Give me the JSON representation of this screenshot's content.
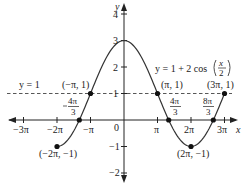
{
  "chart_data": {
    "type": "line",
    "title": "",
    "equation_label": "y = 1 + 2 cos(x/2)",
    "xlabel": "x",
    "ylabel": "y",
    "xlim": [
      -3.14159,
      3.14159
    ],
    "x_range_pi": [
      -3,
      3
    ],
    "ylim": [
      -2,
      4
    ],
    "grid": false,
    "x_ticks": [
      "-3π",
      "-2π",
      "-π",
      "0",
      "π",
      "2π",
      "3π"
    ],
    "y_ticks": [
      "4",
      "3",
      "2",
      "1",
      "-1",
      "-2"
    ],
    "series": [
      {
        "name": "y = 1 + 2 cos(x/2)",
        "domain_pi": [
          -2,
          3
        ],
        "x": [
          "-2π",
          "-4π/3",
          "-π",
          "0",
          "π",
          "4π/3",
          "2π",
          "8π/3",
          "3π"
        ],
        "values": [
          -1,
          0,
          1,
          3,
          1,
          0,
          -1,
          0,
          1
        ]
      },
      {
        "name": "y = 1",
        "style": "dashed",
        "values": [
          1
        ]
      }
    ],
    "points": [
      {
        "label": "(-2π, -1)",
        "x_pi": -2,
        "y": -1
      },
      {
        "label": "(-π, 1)",
        "x_pi": -1,
        "y": 1
      },
      {
        "label": "(π, 1)",
        "x_pi": 1,
        "y": 1
      },
      {
        "label": "(2π, -1)",
        "x_pi": 2,
        "y": -1
      },
      {
        "label": "(3π, 1)",
        "x_pi": 3,
        "y": 1
      },
      {
        "label": "-4π/3",
        "x_pi": -1.3333,
        "y": 0
      },
      {
        "label": "4π/3",
        "x_pi": 1.3333,
        "y": 0
      },
      {
        "label": "8π/3",
        "x_pi": 2.6667,
        "y": 0
      }
    ],
    "annotations": {
      "hline": "y = 1",
      "equation": "y = 1 + 2 cos(x/2)",
      "zero_frac_left": {
        "num": "4π",
        "den": "3",
        "sign": "−"
      },
      "zero_frac_mid": {
        "num": "4π",
        "den": "3"
      },
      "zero_frac_right": {
        "num": "8π",
        "den": "3"
      }
    }
  },
  "labels": {
    "x_axis": "x",
    "y_axis": "y",
    "ticks_x": {
      "m3": "−3π",
      "m2": "−2π",
      "m1": "−π",
      "zero": "0",
      "p1": "π",
      "p2": "2π",
      "p3": "3π"
    },
    "ticks_y": {
      "p4": "4",
      "p3": "3",
      "p2": "2",
      "p1": "1",
      "m1": "−1",
      "m2": "−2"
    },
    "hline": "y = 1",
    "eq_prefix": "y = 1 + 2 cos",
    "eq_num": "x",
    "eq_den": "2",
    "pt_m2": "(−2π, −1)",
    "pt_m1": "(−π, 1)",
    "pt_p1": "(π, 1)",
    "pt_p2": "(2π, −1)",
    "pt_p3": "(3π, 1)",
    "fr_num_4pi": "4π",
    "fr_num_8pi": "8π",
    "fr_den": "3"
  }
}
